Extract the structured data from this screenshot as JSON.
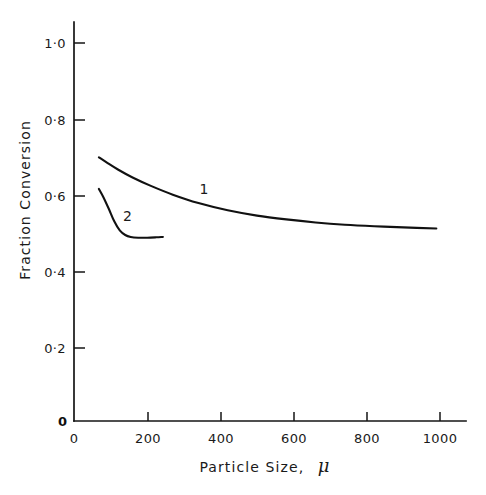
{
  "chart_data": {
    "type": "line",
    "title": "",
    "xlabel": "Particle Size, μ",
    "xlabel_text": "Particle Size,",
    "xlabel_symbol": "μ",
    "ylabel": "Fraction Conversion",
    "xlim": [
      0,
      1080
    ],
    "ylim": [
      0,
      1.11
    ],
    "grid": false,
    "legend": "inline-curve-labels",
    "xticks": [
      0,
      200,
      400,
      600,
      800,
      1000
    ],
    "xticklabels": [
      "0",
      "200",
      "400",
      "600",
      "800",
      "1000"
    ],
    "yticks": [
      0,
      0.2,
      0.4,
      0.6,
      0.8,
      1.0
    ],
    "yticklabels": [
      "0",
      "0·2",
      "0·4",
      "0·6",
      "0·8",
      "1·0"
    ],
    "series": [
      {
        "name": "1",
        "label": "1",
        "label_x": 355,
        "label_y": 0.605,
        "x": [
          68,
          90,
          120,
          160,
          210,
          270,
          340,
          420,
          500,
          580,
          660,
          740,
          820,
          900,
          990
        ],
        "y": [
          0.7,
          0.686,
          0.668,
          0.647,
          0.625,
          0.602,
          0.58,
          0.561,
          0.547,
          0.537,
          0.529,
          0.523,
          0.519,
          0.516,
          0.513
        ]
      },
      {
        "name": "2",
        "label": "2",
        "label_x": 146,
        "label_y": 0.532,
        "x": [
          68,
          80,
          95,
          110,
          125,
          140,
          155,
          175,
          200,
          225,
          243
        ],
        "y": [
          0.617,
          0.596,
          0.565,
          0.532,
          0.508,
          0.496,
          0.491,
          0.489,
          0.489,
          0.49,
          0.491
        ]
      }
    ]
  },
  "axes": {
    "y_axis_name": "y-axis",
    "x_axis_name": "x-axis",
    "y_zero_label": "0",
    "x_zero_label": "0"
  },
  "colors": {
    "ink": "#111111",
    "background": "#ffffff",
    "text": "#1a1a1a"
  }
}
